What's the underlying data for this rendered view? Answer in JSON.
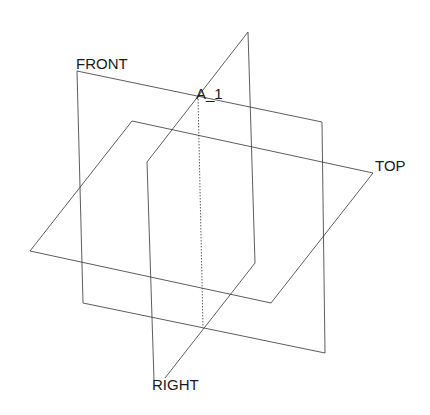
{
  "diagram": {
    "type": "datum-planes-3d",
    "line_color": "#333333",
    "background": "#ffffff",
    "labels": {
      "front": "FRONT",
      "top": "TOP",
      "right": "RIGHT",
      "axis": "A_1"
    },
    "planes": {
      "front": [
        [
          77,
          71
        ],
        [
          322,
          122
        ],
        [
          325,
          353
        ],
        [
          83,
          303
        ]
      ],
      "top": [
        [
          132,
          121
        ],
        [
          373,
          173
        ],
        [
          271,
          303
        ],
        [
          30,
          251
        ]
      ],
      "right": [
        [
          248,
          32
        ],
        [
          255,
          263
        ],
        [
          165,
          378
        ],
        [
          154,
          380
        ],
        [
          147,
          162
        ]
      ]
    },
    "axis": [
      [
        198,
        96
      ],
      [
        203,
        327
      ]
    ]
  }
}
